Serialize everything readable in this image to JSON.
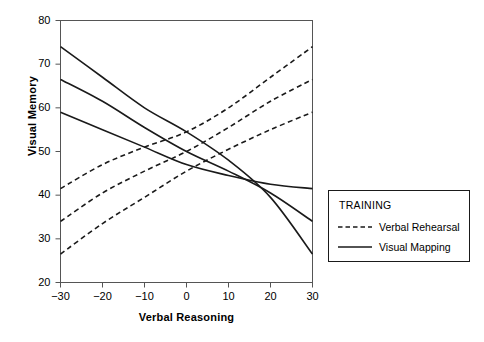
{
  "chart_data": {
    "type": "line",
    "title": "",
    "xlabel": "Verbal Reasoning",
    "ylabel": "Visual Memory",
    "xlim": [
      -30,
      30
    ],
    "ylim": [
      20,
      80
    ],
    "xticks": [
      -30,
      -20,
      -10,
      0,
      10,
      20,
      30
    ],
    "xtick_labels": [
      "−30",
      "−20",
      "−10",
      "0",
      "10",
      "20",
      "30"
    ],
    "yticks": [
      20,
      30,
      40,
      50,
      60,
      70,
      80
    ],
    "ytick_labels": [
      "20",
      "30",
      "40",
      "50",
      "60",
      "70",
      "80"
    ],
    "grid": false,
    "legend_position": "right-outside",
    "legend_title": "TRAINING",
    "x": [
      -30,
      -20,
      -10,
      0,
      10,
      20,
      30
    ],
    "series": [
      {
        "name": "Verbal Rehearsal",
        "group": "Verbal Rehearsal",
        "style": "dashed",
        "color": "#1a1a1a",
        "values": [
          41.5,
          47.0,
          51.0,
          54.5,
          60.0,
          67.0,
          74.0
        ]
      },
      {
        "name": "Verbal Rehearsal",
        "group": "Verbal Rehearsal",
        "style": "dashed",
        "color": "#1a1a1a",
        "values": [
          34.0,
          40.5,
          45.5,
          50.0,
          55.5,
          61.5,
          66.5
        ]
      },
      {
        "name": "Verbal Rehearsal",
        "group": "Verbal Rehearsal",
        "style": "dashed",
        "color": "#1a1a1a",
        "values": [
          26.5,
          33.5,
          39.5,
          45.5,
          50.5,
          55.0,
          59.0
        ]
      },
      {
        "name": "Visual Mapping",
        "group": "Visual Mapping",
        "style": "solid",
        "color": "#1a1a1a",
        "values": [
          74.0,
          67.0,
          60.0,
          54.5,
          48.0,
          39.5,
          26.5
        ]
      },
      {
        "name": "Visual Mapping",
        "group": "Visual Mapping",
        "style": "solid",
        "color": "#1a1a1a",
        "values": [
          66.5,
          61.5,
          55.5,
          50.0,
          45.5,
          40.5,
          34.0
        ]
      },
      {
        "name": "Visual Mapping",
        "group": "Visual Mapping",
        "style": "solid",
        "color": "#1a1a1a",
        "values": [
          59.0,
          55.0,
          51.0,
          47.0,
          44.5,
          42.5,
          41.5
        ]
      }
    ],
    "legend_entries": [
      {
        "label": "Verbal Rehearsal",
        "style": "dashed"
      },
      {
        "label": "Visual Mapping",
        "style": "solid"
      }
    ]
  },
  "colors": {
    "line": "#1a1a1a",
    "axis": "#444444",
    "text": "#000000",
    "background": "#ffffff"
  }
}
